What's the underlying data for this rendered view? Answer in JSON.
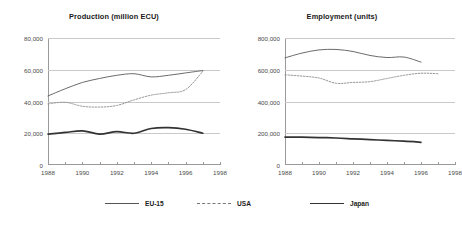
{
  "legend": {
    "position": "bottom",
    "items": [
      {
        "key": "eu15",
        "label": "EU-15",
        "style": "solid-thin"
      },
      {
        "key": "usa",
        "label": "USA",
        "style": "dotted"
      },
      {
        "key": "japan",
        "label": "Japan",
        "style": "solid-thick"
      }
    ]
  },
  "chart_data": [
    {
      "type": "line",
      "title": "Production (million ECU)",
      "xlabel": "",
      "ylabel": "",
      "grid": true,
      "xlim": [
        1988,
        1998
      ],
      "ylim": [
        0,
        80000
      ],
      "yticks": [
        0,
        20000,
        40000,
        60000,
        80000
      ],
      "ytick_labels": [
        "0",
        "20,000",
        "40,000",
        "60,000",
        "80,000"
      ],
      "xticks": [
        1988,
        1990,
        1992,
        1994,
        1996,
        1998
      ],
      "xtick_labels": [
        "1988",
        "1990",
        "1992",
        "1994",
        "1996",
        "1998"
      ],
      "x": [
        1988,
        1989,
        1990,
        1991,
        1992,
        1993,
        1994,
        1995,
        1996,
        1997
      ],
      "series": [
        {
          "name": "EU-15",
          "style": "solid-thin",
          "values": [
            43500,
            48000,
            52000,
            54500,
            56500,
            57500,
            55500,
            56500,
            58000,
            59500
          ]
        },
        {
          "name": "USA",
          "style": "dotted",
          "values": [
            38500,
            39500,
            37000,
            36500,
            37500,
            41000,
            44000,
            45500,
            47500,
            59000
          ]
        },
        {
          "name": "Japan",
          "style": "solid-thick",
          "values": [
            19500,
            20500,
            21500,
            19500,
            21000,
            20000,
            23000,
            23500,
            22500,
            20000
          ]
        }
      ]
    },
    {
      "type": "line",
      "title": "Employment (units)",
      "xlabel": "",
      "ylabel": "",
      "grid": true,
      "xlim": [
        1988,
        1998
      ],
      "ylim": [
        0,
        800000
      ],
      "yticks": [
        0,
        200000,
        400000,
        600000,
        800000
      ],
      "ytick_labels": [
        "0",
        "200,000",
        "400,000",
        "600,000",
        "800,000"
      ],
      "xticks": [
        1988,
        1990,
        1992,
        1994,
        1996,
        1998
      ],
      "xtick_labels": [
        "1988",
        "1990",
        "1992",
        "1994",
        "1996",
        "1998"
      ],
      "x": [
        1988,
        1989,
        1990,
        1991,
        1992,
        1993,
        1994,
        1995,
        1996,
        1997
      ],
      "series": [
        {
          "name": "EU-15",
          "style": "solid-thin",
          "values": [
            675000,
            705000,
            725000,
            728000,
            715000,
            690000,
            677000,
            680000,
            648000,
            null
          ]
        },
        {
          "name": "USA",
          "style": "dotted",
          "values": [
            568000,
            560000,
            548000,
            515000,
            520000,
            525000,
            545000,
            565000,
            578000,
            575000
          ]
        },
        {
          "name": "Japan",
          "style": "solid-thick",
          "values": [
            176000,
            175000,
            173000,
            170000,
            165000,
            160000,
            155000,
            150000,
            143000,
            null
          ]
        }
      ]
    }
  ]
}
